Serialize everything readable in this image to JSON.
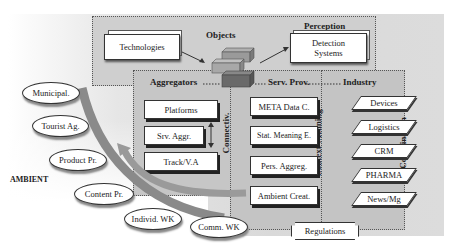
{
  "diagram": {
    "layers": {
      "objects": {
        "title": "Objects"
      },
      "perception": {
        "title": "Perception"
      },
      "aggregators": {
        "title": "Aggregators"
      },
      "serv_prov": {
        "title": "Serv. Prov."
      },
      "industry": {
        "title": "Industry"
      },
      "connectiv": {
        "title": "Connectiv."
      },
      "context_meaning": {
        "title": "Context-Meaning"
      },
      "coordination": {
        "title": "Coordination"
      }
    },
    "objects_boxes": {
      "technologies": "Technologies",
      "detection_systems_line1": "Detection",
      "detection_systems_line2": "Systems"
    },
    "aggregators_items": [
      "Platforms",
      "Srv. Aggr.",
      "Track/V.A"
    ],
    "serv_prov_items": [
      "META Data C.",
      "Stat. Meaning E.",
      "Pers. Aggreg.",
      "Ambient Creat."
    ],
    "industry_items": [
      "Devices",
      "Logistics",
      "CRM",
      "PHARMA",
      "News/Mg"
    ],
    "ambient": {
      "label": "AMBIENT",
      "actors": [
        "Municipal.",
        "Tourist Ag.",
        "Product Pr.",
        "Content Pr.",
        "Individ. WK",
        "Comm. WK"
      ]
    },
    "regulations": "Regulations",
    "colors": {
      "panel": "#d9d9d9",
      "region": "#c6c6c6",
      "arc": "#8a8a8a",
      "cube_dark": "#6a6a6a",
      "cube_light": "#9a9a9a"
    }
  }
}
